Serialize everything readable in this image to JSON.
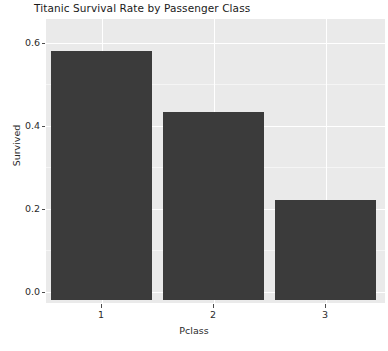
{
  "chart_data": {
    "type": "bar",
    "title": "Titanic Survival Rate by Passenger Class",
    "xlabel": "Pclass",
    "ylabel": "Survived",
    "categories": [
      "1",
      "2",
      "3"
    ],
    "values": [
      0.63,
      0.47,
      0.24
    ],
    "ylim": [
      0.0,
      0.685
    ],
    "yticks": [
      0.0,
      0.2,
      0.4,
      0.6
    ],
    "ytick_labels": [
      "0.0",
      "0.2",
      "0.4",
      "0.6"
    ],
    "xtick_labels": [
      "1",
      "2",
      "3"
    ],
    "grid": true,
    "legend": "none",
    "series": [
      {
        "name": "Survived",
        "values": [
          0.63,
          0.47,
          0.24
        ]
      }
    ],
    "colors": {
      "bar": "#3b3b3b",
      "panel_background": "#eaeaea",
      "figure_background": "#ffffff",
      "gridline": "#ffffff",
      "text": "#2b2b2b"
    }
  }
}
